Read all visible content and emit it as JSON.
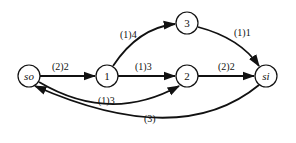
{
  "diagram": {
    "type": "flow-network",
    "nodes": [
      {
        "id": "so",
        "label": "so",
        "italic": true,
        "x": 29,
        "y": 76
      },
      {
        "id": "1",
        "label": "1",
        "italic": false,
        "x": 107,
        "y": 76
      },
      {
        "id": "2",
        "label": "2",
        "italic": false,
        "x": 187,
        "y": 76
      },
      {
        "id": "3",
        "label": "3",
        "italic": false,
        "x": 187,
        "y": 23
      },
      {
        "id": "si",
        "label": "si",
        "italic": true,
        "x": 266,
        "y": 76
      }
    ],
    "edges": [
      {
        "from": "so",
        "to": "1",
        "label": "(2)2"
      },
      {
        "from": "1",
        "to": "3",
        "label": "(1)4"
      },
      {
        "from": "1",
        "to": "2",
        "label": "(1)3"
      },
      {
        "from": "so",
        "to": "2",
        "label": "(1)3"
      },
      {
        "from": "3",
        "to": "si",
        "label": "(1)1"
      },
      {
        "from": "2",
        "to": "si",
        "label": "(2)2"
      },
      {
        "from": "si",
        "to": "so",
        "label": "(3)"
      }
    ]
  }
}
